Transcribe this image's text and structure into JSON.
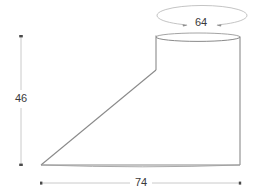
{
  "drawing": {
    "type": "engineering-dimension-drawing",
    "subject": "oblique truncated cone / lampshade profile",
    "units_note": "",
    "colors": {
      "background": "#ffffff",
      "outline": "#8c8c8c",
      "outline_dark": "#707070",
      "dimension_line": "#b0b0b0",
      "dimension_text": "#3a3a3a",
      "tick": "#555555"
    },
    "dimensions": [
      {
        "name": "top-diameter",
        "label": "64",
        "kind": "diameter",
        "label_x": 201,
        "label_y": 23,
        "orientation": "elliptical",
        "ellipse": {
          "cx": 202,
          "cy": 16,
          "rx": 45,
          "ry": 10
        }
      },
      {
        "name": "height",
        "label": "46",
        "kind": "linear-vertical",
        "label_x": 21,
        "label_y": 99,
        "line": {
          "x1": 21,
          "y1": 36,
          "x2": 21,
          "y2": 165
        }
      },
      {
        "name": "width",
        "label": "74",
        "kind": "linear-horizontal",
        "label_x": 141,
        "label_y": 183,
        "line": {
          "x1": 41,
          "y1": 183,
          "x2": 240,
          "y2": 183
        }
      }
    ],
    "geometry": {
      "top_ellipse": {
        "cx": 198,
        "cy": 37,
        "rx": 42,
        "ry": 4
      },
      "right_edge": {
        "x1": 240,
        "y1": 37,
        "x2": 240,
        "y2": 165
      },
      "left_edge": {
        "x1": 156,
        "y1": 35,
        "x2": 156,
        "y2": 70
      },
      "slant_edge": {
        "x1": 156,
        "y1": 70,
        "x2": 41,
        "y2": 165
      },
      "base_line": {
        "x1": 41,
        "y1": 165,
        "x2": 240,
        "y2": 165
      },
      "apex": {
        "x": 41,
        "y": 165
      }
    }
  }
}
